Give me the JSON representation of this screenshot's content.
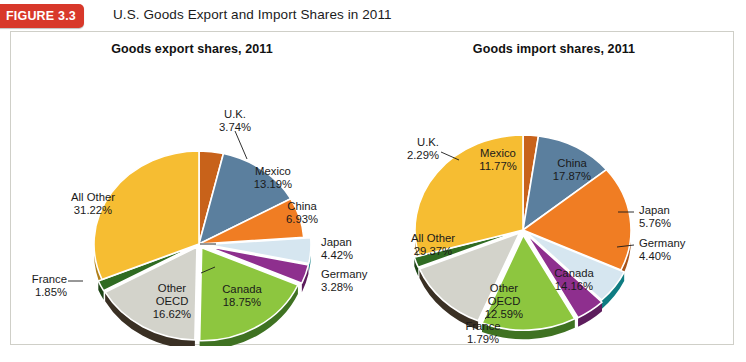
{
  "header": {
    "badge_label": "FIGURE 3.3",
    "title": "U.S. Goods Export and Import Shares in 2011"
  },
  "chart_data": [
    {
      "type": "pie",
      "title": "Goods export shares, 2011",
      "xlabel": "",
      "ylabel": "",
      "legend_position": "none",
      "grid": false,
      "units": "percent",
      "categories": [
        "U.K.",
        "Mexico",
        "China",
        "Japan",
        "Germany",
        "Canada",
        "Other OECD",
        "France",
        "All Other"
      ],
      "values": [
        3.74,
        13.19,
        6.93,
        4.42,
        3.28,
        18.75,
        16.62,
        1.85,
        31.22
      ],
      "slices": [
        {
          "name": "U.K.",
          "label": "U.K.",
          "value_label": "3.74%",
          "value": 3.74,
          "color": "#c8621a",
          "shadow": "#8a4110"
        },
        {
          "name": "Mexico",
          "label": "Mexico",
          "value_label": "13.19%",
          "value": 13.19,
          "color": "#5b7f9e",
          "shadow": "#3e5b73"
        },
        {
          "name": "China",
          "label": "China",
          "value_label": "6.93%",
          "value": 6.93,
          "color": "#f07d23",
          "shadow": "#a8531a"
        },
        {
          "name": "Japan",
          "label": "Japan",
          "value_label": "4.42%",
          "value": 4.42,
          "color": "#d6e6f0",
          "shadow": "#0f7c82"
        },
        {
          "name": "Germany",
          "label": "Germany",
          "value_label": "3.28%",
          "value": 3.28,
          "color": "#8e2f8e",
          "shadow": "#5d1d5d"
        },
        {
          "name": "Canada",
          "label": "Canada",
          "value_label": "18.75%",
          "value": 18.75,
          "color": "#8dc63f",
          "shadow": "#3f7222"
        },
        {
          "name": "Other OECD",
          "label": "Other OECD",
          "value_label": "16.62%",
          "value": 16.62,
          "color": "#d3d3cb",
          "shadow": "#3a3024"
        },
        {
          "name": "France",
          "label": "France",
          "value_label": "1.85%",
          "value": 1.85,
          "color": "#2f6b22",
          "shadow": "#1d4415"
        },
        {
          "name": "All Other",
          "label": "All Other",
          "value_label": "31.22%",
          "value": 31.22,
          "color": "#f6bd32",
          "shadow": "#b07f18"
        }
      ]
    },
    {
      "type": "pie",
      "title": "Goods import shares, 2011",
      "xlabel": "",
      "ylabel": "",
      "legend_position": "none",
      "grid": false,
      "units": "percent",
      "categories": [
        "U.K.",
        "Mexico",
        "China",
        "Japan",
        "Germany",
        "Canada",
        "Other OECD",
        "France",
        "All Other"
      ],
      "values": [
        2.29,
        11.77,
        17.87,
        5.76,
        4.4,
        14.16,
        12.59,
        1.79,
        29.37
      ],
      "slices": [
        {
          "name": "U.K.",
          "label": "U.K.",
          "value_label": "2.29%",
          "value": 2.29,
          "color": "#c8621a",
          "shadow": "#8a4110"
        },
        {
          "name": "Mexico",
          "label": "Mexico",
          "value_label": "11.77%",
          "value": 11.77,
          "color": "#5b7f9e",
          "shadow": "#3e5b73"
        },
        {
          "name": "China",
          "label": "China",
          "value_label": "17.87%",
          "value": 17.87,
          "color": "#f07d23",
          "shadow": "#a8531a"
        },
        {
          "name": "Japan",
          "label": "Japan",
          "value_label": "5.76%",
          "value": 5.76,
          "color": "#d6e6f0",
          "shadow": "#0f7c82"
        },
        {
          "name": "Germany",
          "label": "Germany",
          "value_label": "4.40%",
          "value": 4.4,
          "color": "#8e2f8e",
          "shadow": "#5d1d5d"
        },
        {
          "name": "Canada",
          "label": "Canada",
          "value_label": "14.16%",
          "value": 14.16,
          "color": "#8dc63f",
          "shadow": "#3f7222"
        },
        {
          "name": "Other OECD",
          "label": "Other OECD",
          "value_label": "12.59%",
          "value": 12.59,
          "color": "#d3d3cb",
          "shadow": "#3a3024"
        },
        {
          "name": "France",
          "label": "France",
          "value_label": "1.79%",
          "value": 1.79,
          "color": "#2f6b22",
          "shadow": "#1d4415"
        },
        {
          "name": "All Other",
          "label": "All Other",
          "value_label": "29.37%",
          "value": 29.37,
          "color": "#f6bd32",
          "shadow": "#b07f18"
        }
      ]
    }
  ],
  "export_labels": {
    "uk_name": "U.K.",
    "uk_value": "3.74%",
    "mexico_name": "Mexico",
    "mexico_value": "13.19%",
    "china_name": "China",
    "china_value": "6.93%",
    "japan_name": "Japan",
    "japan_value": "4.42%",
    "germany_name": "Germany",
    "germany_value": "3.28%",
    "canada_name": "Canada",
    "canada_value": "18.75%",
    "oecd_name1": "Other",
    "oecd_name2": "OECD",
    "oecd_value": "16.62%",
    "france_name": "France",
    "france_value": "1.85%",
    "allother_name": "All Other",
    "allother_value": "31.22%"
  },
  "import_labels": {
    "uk_name": "U.K.",
    "uk_value": "2.29%",
    "mexico_name": "Mexico",
    "mexico_value": "11.77%",
    "china_name": "China",
    "china_value": "17.87%",
    "japan_name": "Japan",
    "japan_value": "5.76%",
    "germany_name": "Germany",
    "germany_value": "4.40%",
    "canada_name": "Canada",
    "canada_value": "14.16%",
    "oecd_name1": "Other",
    "oecd_name2": "OECD",
    "oecd_value": "12.59%",
    "france_name": "France",
    "france_value": "1.79%",
    "allother_name": "All Other",
    "allother_value": "29.37%"
  },
  "colors": {
    "badge_red": "#d8382a",
    "frame_border": "#cfcfc8",
    "background": "#ffffff",
    "text": "#1a1a1a"
  }
}
